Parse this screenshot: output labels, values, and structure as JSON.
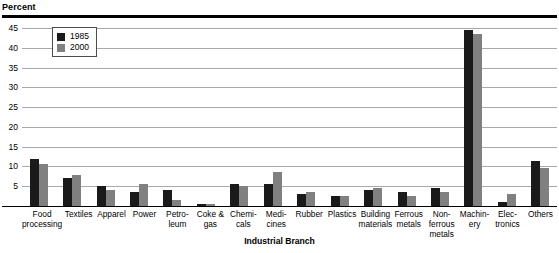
{
  "axis_title_y": "Percent",
  "axis_title_x": "Industrial Branch",
  "legend": {
    "items": [
      {
        "label": "1985",
        "color": "#1a1a1a"
      },
      {
        "label": "2000",
        "color": "#808080"
      }
    ]
  },
  "yticks": [
    "45",
    "40",
    "35",
    "30",
    "25",
    "20",
    "15",
    "10",
    "5"
  ],
  "chart_data": {
    "type": "bar",
    "title": "",
    "xlabel": "Industrial Branch",
    "ylabel": "Percent",
    "ylim": [
      0,
      46
    ],
    "ytick_values": [
      45,
      40,
      35,
      30,
      25,
      20,
      15,
      10,
      5
    ],
    "grid": true,
    "legend_position": "top-left-inside",
    "categories": [
      "Food processing",
      "Textiles",
      "Apparel",
      "Power",
      "Petro-leum",
      "Coke & gas",
      "Chemi-cals",
      "Medi-cines",
      "Rubber",
      "Plastics",
      "Building materials",
      "Ferrous metals",
      "Non-ferrous metals",
      "Machin-ery",
      "Elec-tronics",
      "Others"
    ],
    "category_lines": [
      [
        "Food",
        "processing"
      ],
      [
        "Textiles"
      ],
      [
        "Apparel"
      ],
      [
        "Power"
      ],
      [
        "Petro-",
        "leum"
      ],
      [
        "Coke &",
        "gas"
      ],
      [
        "Chemi-",
        "cals"
      ],
      [
        "Medi-",
        "cines"
      ],
      [
        "Rubber"
      ],
      [
        "Plastics"
      ],
      [
        "Building",
        "materials"
      ],
      [
        "Ferrous",
        "metals"
      ],
      [
        "Non-",
        "ferrous",
        "metals"
      ],
      [
        "Machin-",
        "ery"
      ],
      [
        "Elec-",
        "tronics"
      ],
      [
        "Others"
      ]
    ],
    "series": [
      {
        "name": "1985",
        "color": "#1a1a1a",
        "values": [
          12.0,
          7.0,
          5.0,
          3.5,
          4.0,
          0.4,
          5.5,
          5.5,
          3.0,
          2.5,
          4.0,
          3.5,
          4.5,
          44.5,
          1.0,
          11.5
        ]
      },
      {
        "name": "2000",
        "color": "#808080",
        "values": [
          10.5,
          7.8,
          4.0,
          5.5,
          1.5,
          0.4,
          5.0,
          8.5,
          3.5,
          2.5,
          4.5,
          2.5,
          3.5,
          43.5,
          3.0,
          9.5
        ]
      }
    ]
  }
}
